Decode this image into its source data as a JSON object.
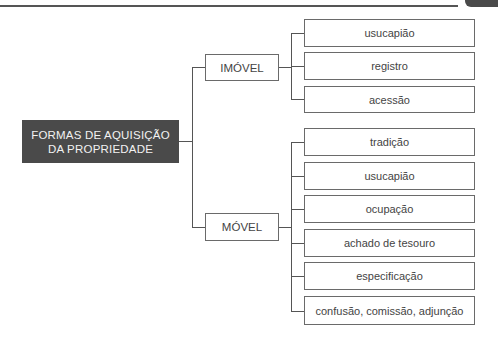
{
  "diagram": {
    "root": {
      "line1": "FORMAS DE AQUISIÇÃO",
      "line2": "DA PROPRIEDADE"
    },
    "branches": [
      {
        "label": "IMÓVEL",
        "children": [
          "usucapião",
          "registro",
          "acessão"
        ]
      },
      {
        "label": "MÓVEL",
        "children": [
          "tradição",
          "usucapião",
          "ocupação",
          "achado de tesouro",
          "especificação",
          "confusão, comissão, adjunção"
        ]
      }
    ]
  },
  "colors": {
    "root_bg": "#4a4a4a",
    "root_text": "#f2f2f2",
    "line": "#555555"
  }
}
